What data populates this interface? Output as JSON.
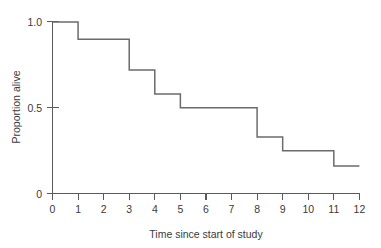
{
  "chart_data": {
    "type": "line",
    "subtype": "step-kaplan-meier",
    "title": "",
    "xlabel": "Time since start of study",
    "ylabel": "Proportion alive",
    "xlim": [
      0,
      12
    ],
    "ylim": [
      0,
      1.0
    ],
    "grid": false,
    "legend": null,
    "xticks": [
      0,
      1,
      2,
      3,
      4,
      5,
      6,
      7,
      8,
      9,
      10,
      11,
      12
    ],
    "xtick_labels": [
      "0",
      "1",
      "2",
      "3",
      "4",
      "5",
      "6",
      "7",
      "8",
      "9",
      "10",
      "11",
      "12"
    ],
    "yticks": [
      0,
      0.5,
      1.0
    ],
    "ytick_labels": [
      "0",
      "0.5",
      "1.0"
    ],
    "x": [
      0,
      1,
      3,
      4,
      5,
      8,
      9,
      11,
      12
    ],
    "y": [
      1.0,
      0.9,
      0.72,
      0.58,
      0.5,
      0.33,
      0.25,
      0.16,
      0.16
    ],
    "steps": [
      {
        "x_start": 0,
        "x_end": 1,
        "value": 1.0
      },
      {
        "x_start": 1,
        "x_end": 3,
        "value": 0.9
      },
      {
        "x_start": 3,
        "x_end": 4,
        "value": 0.72
      },
      {
        "x_start": 4,
        "x_end": 5,
        "value": 0.58
      },
      {
        "x_start": 5,
        "x_end": 8,
        "value": 0.5
      },
      {
        "x_start": 8,
        "x_end": 9,
        "value": 0.33
      },
      {
        "x_start": 9,
        "x_end": 11,
        "value": 0.25
      },
      {
        "x_start": 11,
        "x_end": 12,
        "value": 0.16
      }
    ],
    "line_color": "#6b6b6b",
    "axis_color": "#5a5a5a",
    "background_color": "#ffffff"
  },
  "axes": {
    "y_label": "Proportion alive",
    "x_label": "Time since start of study",
    "y_tick_1": "1.0",
    "y_tick_2": "0.5",
    "y_tick_3": "0",
    "x_tick_0": "0",
    "x_tick_1": "1",
    "x_tick_2": "2",
    "x_tick_3": "3",
    "x_tick_4": "4",
    "x_tick_5": "5",
    "x_tick_6": "6",
    "x_tick_7": "7",
    "x_tick_8": "8",
    "x_tick_9": "9",
    "x_tick_10": "10",
    "x_tick_11": "11",
    "x_tick_12": "12"
  }
}
